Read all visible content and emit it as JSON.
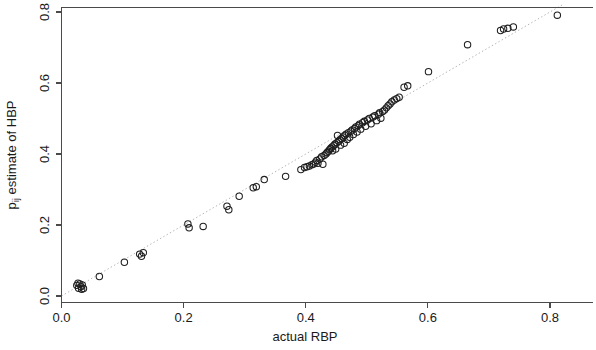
{
  "figure": {
    "width": 596,
    "height": 350,
    "background": "#ffffff",
    "point_color": "#1f1f1f",
    "axis_color": "#4a4a4a",
    "reference_line_color": "#b4b4b4"
  },
  "chart_data": {
    "type": "scatter",
    "title": "",
    "xlabel": "actual RBP",
    "ylabel": "p̂ij estimate of HBP",
    "ylabel_plain": "pij estimate of HBP",
    "xlim": [
      0.0,
      0.84
    ],
    "ylim": [
      0.0,
      0.82
    ],
    "xticks": [
      0.0,
      0.2,
      0.4,
      0.6,
      0.8
    ],
    "yticks": [
      0.0,
      0.2,
      0.4,
      0.6,
      0.8
    ],
    "xticklabels": [
      "0.0",
      "0.2",
      "0.4",
      "0.6",
      "0.8"
    ],
    "yticklabels": [
      "0.0",
      "0.2",
      "0.4",
      "0.6",
      "0.8"
    ],
    "grid": false,
    "legend": null,
    "marker": "open-circle",
    "marker_radius_px": 3.2,
    "annotations": [
      {
        "type": "reference-line",
        "description": "dotted identity line y = x",
        "style": "dotted",
        "from": [
          0.0,
          0.0
        ],
        "to": [
          0.82,
          0.82
        ]
      }
    ],
    "n_points": 95,
    "points": [
      [
        0.025,
        0.03
      ],
      [
        0.028,
        0.022
      ],
      [
        0.03,
        0.034
      ],
      [
        0.032,
        0.026
      ],
      [
        0.034,
        0.031
      ],
      [
        0.036,
        0.021
      ],
      [
        0.027,
        0.036
      ],
      [
        0.033,
        0.019
      ],
      [
        0.062,
        0.055
      ],
      [
        0.103,
        0.095
      ],
      [
        0.128,
        0.118
      ],
      [
        0.134,
        0.122
      ],
      [
        0.131,
        0.112
      ],
      [
        0.207,
        0.203
      ],
      [
        0.209,
        0.192
      ],
      [
        0.232,
        0.196
      ],
      [
        0.271,
        0.253
      ],
      [
        0.274,
        0.243
      ],
      [
        0.291,
        0.281
      ],
      [
        0.314,
        0.305
      ],
      [
        0.319,
        0.308
      ],
      [
        0.332,
        0.328
      ],
      [
        0.367,
        0.337
      ],
      [
        0.392,
        0.356
      ],
      [
        0.398,
        0.362
      ],
      [
        0.402,
        0.364
      ],
      [
        0.406,
        0.366
      ],
      [
        0.41,
        0.37
      ],
      [
        0.413,
        0.372
      ],
      [
        0.416,
        0.377
      ],
      [
        0.418,
        0.382
      ],
      [
        0.42,
        0.374
      ],
      [
        0.423,
        0.386
      ],
      [
        0.426,
        0.392
      ],
      [
        0.428,
        0.371
      ],
      [
        0.43,
        0.396
      ],
      [
        0.433,
        0.4
      ],
      [
        0.435,
        0.404
      ],
      [
        0.437,
        0.408
      ],
      [
        0.439,
        0.412
      ],
      [
        0.441,
        0.416
      ],
      [
        0.443,
        0.42
      ],
      [
        0.444,
        0.409
      ],
      [
        0.446,
        0.424
      ],
      [
        0.448,
        0.428
      ],
      [
        0.449,
        0.414
      ],
      [
        0.451,
        0.432
      ],
      [
        0.452,
        0.452
      ],
      [
        0.454,
        0.436
      ],
      [
        0.456,
        0.44
      ],
      [
        0.457,
        0.425
      ],
      [
        0.459,
        0.444
      ],
      [
        0.461,
        0.448
      ],
      [
        0.463,
        0.43
      ],
      [
        0.464,
        0.452
      ],
      [
        0.466,
        0.456
      ],
      [
        0.468,
        0.441
      ],
      [
        0.47,
        0.46
      ],
      [
        0.472,
        0.447
      ],
      [
        0.474,
        0.464
      ],
      [
        0.476,
        0.468
      ],
      [
        0.478,
        0.455
      ],
      [
        0.48,
        0.472
      ],
      [
        0.482,
        0.476
      ],
      [
        0.484,
        0.462
      ],
      [
        0.486,
        0.48
      ],
      [
        0.488,
        0.484
      ],
      [
        0.49,
        0.47
      ],
      [
        0.493,
        0.488
      ],
      [
        0.496,
        0.492
      ],
      [
        0.498,
        0.478
      ],
      [
        0.501,
        0.496
      ],
      [
        0.504,
        0.5
      ],
      [
        0.507,
        0.485
      ],
      [
        0.51,
        0.504
      ],
      [
        0.513,
        0.508
      ],
      [
        0.516,
        0.494
      ],
      [
        0.519,
        0.512
      ],
      [
        0.521,
        0.516
      ],
      [
        0.523,
        0.501
      ],
      [
        0.526,
        0.52
      ],
      [
        0.529,
        0.524
      ],
      [
        0.532,
        0.53
      ],
      [
        0.535,
        0.536
      ],
      [
        0.538,
        0.541
      ],
      [
        0.541,
        0.547
      ],
      [
        0.545,
        0.552
      ],
      [
        0.549,
        0.556
      ],
      [
        0.553,
        0.56
      ],
      [
        0.561,
        0.588
      ],
      [
        0.567,
        0.592
      ],
      [
        0.601,
        0.632
      ],
      [
        0.665,
        0.708
      ],
      [
        0.719,
        0.748
      ],
      [
        0.724,
        0.752
      ],
      [
        0.731,
        0.754
      ],
      [
        0.74,
        0.758
      ],
      [
        0.812,
        0.791
      ]
    ]
  },
  "axes": {
    "x_title": "actual RBP",
    "y_title_prefix": "p",
    "y_title_subscript": "ij",
    "y_title_rest": " estimate of HBP"
  }
}
